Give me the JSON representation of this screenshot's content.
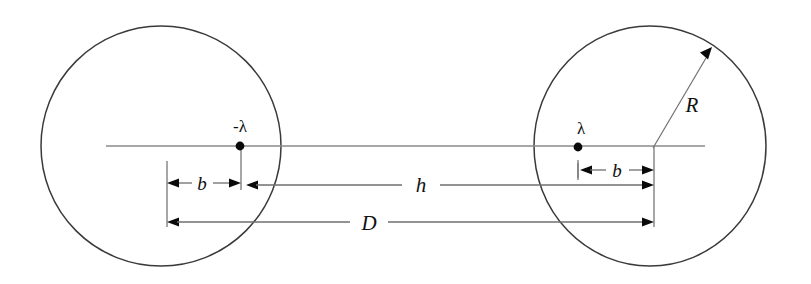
{
  "figure": {
    "type": "physics-diagram",
    "background_color": "#ffffff",
    "stroke_color": "#3a3a3a",
    "label_color": "#111111"
  },
  "labels": {
    "left_charge": "-λ",
    "right_charge": "λ",
    "radius": "R",
    "left_offset": "b",
    "right_offset": "b",
    "gap": "h",
    "separation": "D"
  },
  "geometry": {
    "left_circle": {
      "cx": 161,
      "cy": 146,
      "r": 120
    },
    "right_circle": {
      "cx": 650,
      "cy": 146,
      "r": 116
    },
    "axis": {
      "x1": 106,
      "y1": 146,
      "x2": 705,
      "y2": 146
    },
    "left_dot": {
      "cx": 240,
      "cy": 146,
      "r": 4.2
    },
    "right_dot": {
      "cx": 578,
      "cy": 147,
      "r": 4.2
    },
    "left_tick_x": 167,
    "right_tick_x": 654,
    "row_b_left_y": 183,
    "row_b_right_y": 170,
    "row_h_y": 185,
    "row_D_y": 222,
    "radius_arrow": {
      "x1": 653,
      "y1": 148,
      "x2": 710,
      "y2": 52
    }
  },
  "label_positions": {
    "left_charge": {
      "x": 240,
      "y": 131
    },
    "right_charge": {
      "x": 580,
      "y": 133
    },
    "radius": {
      "x": 692,
      "y": 112
    },
    "left_offset": {
      "x": 200,
      "y": 190
    },
    "right_offset": {
      "x": 618,
      "y": 177
    },
    "gap": {
      "x": 421,
      "y": 192
    },
    "separation": {
      "x": 369,
      "y": 230
    }
  }
}
